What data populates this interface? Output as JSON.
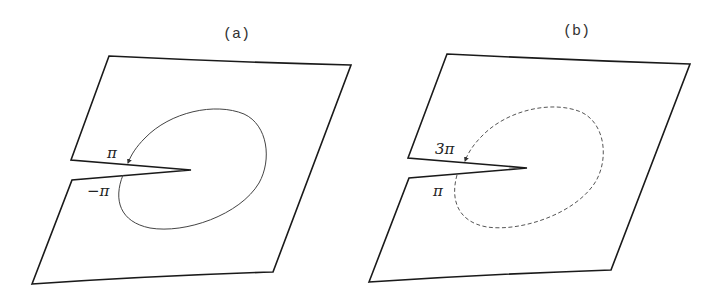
{
  "panels": [
    {
      "id": "a",
      "label": "(a)",
      "loop_style": "solid",
      "upper_edge_label": "π",
      "lower_edge_label": "−π"
    },
    {
      "id": "b",
      "label": "(b)",
      "loop_style": "dashed",
      "upper_edge_label": "3π",
      "lower_edge_label": "π"
    }
  ]
}
